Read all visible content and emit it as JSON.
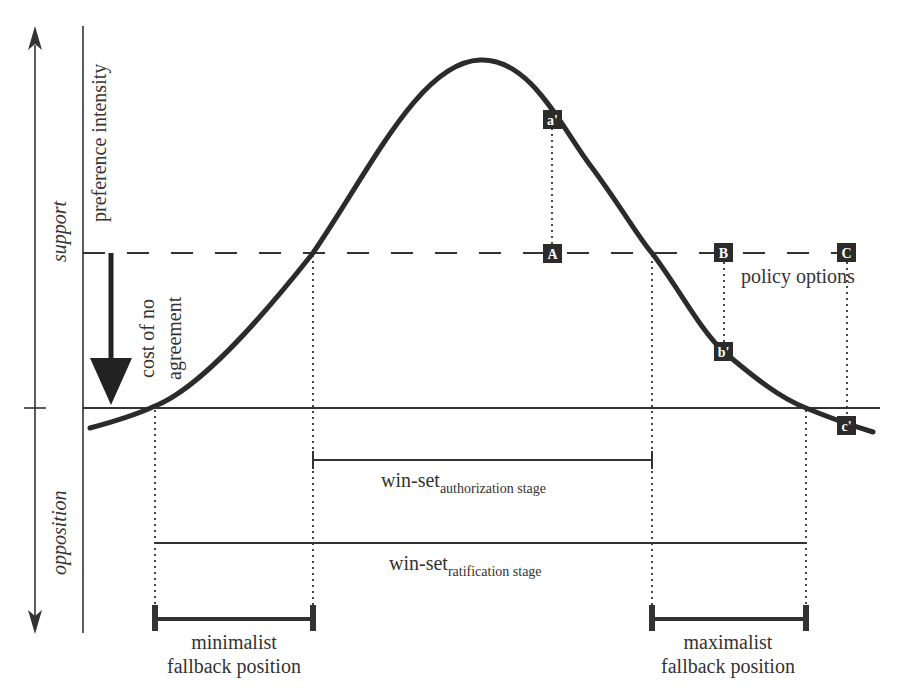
{
  "diagram": {
    "axis_labels": {
      "support": "support",
      "opposition": "opposition",
      "preference_intensity": "preference intensity"
    },
    "cost_label": {
      "line1": "cost of no",
      "line2": "agreement"
    },
    "policy_options_label": "policy options",
    "policy_points": [
      {
        "id": "A",
        "label": "A"
      },
      {
        "id": "B",
        "label": "B"
      },
      {
        "id": "C",
        "label": "C"
      }
    ],
    "curve_points": [
      {
        "id": "a-prime",
        "label": "a'"
      },
      {
        "id": "b-prime",
        "label": "b'"
      },
      {
        "id": "c-prime",
        "label": "c'"
      }
    ],
    "winsets": {
      "authorization": {
        "main": "win-set",
        "sub": "authorization stage"
      },
      "ratification": {
        "main": "win-set",
        "sub": "ratification stage"
      }
    },
    "fallback": {
      "minimalist": {
        "line1": "minimalist",
        "line2": "fallback position"
      },
      "maximalist": {
        "line1": "maximalist",
        "line2": "fallback position"
      }
    },
    "colors": {
      "ink": "#333333",
      "box_fill": "#2b2b2b",
      "background": "#ffffff"
    }
  }
}
